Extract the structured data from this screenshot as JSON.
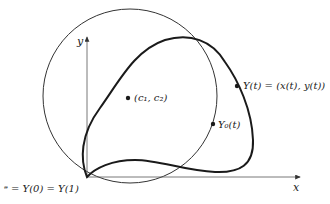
{
  "diagram": {
    "type": "closed-curve-with-circle",
    "axes": {
      "x_label": "x",
      "y_label": "y"
    },
    "labels": {
      "center": "(c₁, c₂)",
      "curve_point": "Y(t) = (x(t), y(t))",
      "circle_point": "Y₀(t)",
      "origin": "ᵊ = Y(0) = Y(1)"
    },
    "origin_label_parts": {
      "origin_symbol": "ᵊ",
      "equation": "= Y(0) = Y(1)"
    },
    "colors": {
      "stroke": "#1a1a1a",
      "axis": "#555555",
      "background": "#ffffff"
    }
  }
}
